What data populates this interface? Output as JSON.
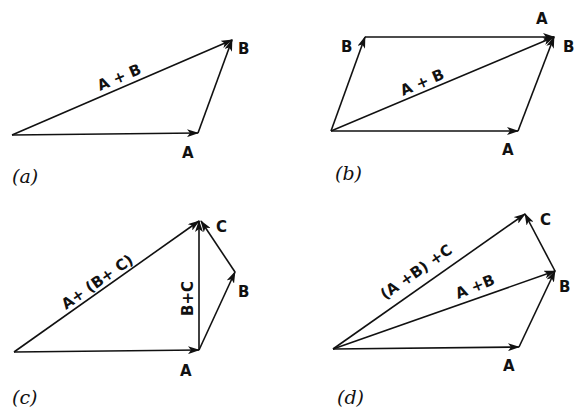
{
  "figure": {
    "panels": [
      {
        "id": "a",
        "caption": "(a)",
        "labels": {
          "A": "A",
          "B": "B",
          "sum": "A + B"
        }
      },
      {
        "id": "b",
        "caption": "(b)",
        "labels": {
          "A_bottom": "A",
          "B_left": "B",
          "A_top": "A",
          "B_right": "B",
          "sum": "A + B"
        }
      },
      {
        "id": "c",
        "caption": "(c)",
        "labels": {
          "A": "A",
          "B": "B",
          "C": "C",
          "BC": "B+C",
          "sum": "A+ (B+ C)"
        }
      },
      {
        "id": "d",
        "caption": "(d)",
        "labels": {
          "A": "A",
          "B": "B",
          "C": "C",
          "AB": "A +B",
          "sum": "(A +B) +C"
        }
      }
    ],
    "colors": {
      "ink": "#111111",
      "background": "#ffffff"
    }
  }
}
